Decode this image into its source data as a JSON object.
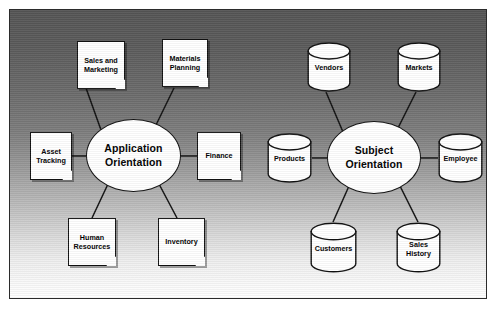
{
  "diagram": {
    "background": {
      "gradient_from": "#555555",
      "gradient_to": "#ffffff",
      "border_color": "#2b2b2b"
    },
    "hubs": [
      {
        "id": "application-orientation",
        "label": "Application\nOrientation",
        "line1": "Application",
        "line2": "Orientation",
        "shape": "ellipse"
      },
      {
        "id": "subject-orientation",
        "label": "Subject\nOrientation",
        "line1": "Subject",
        "line2": "Orientation",
        "shape": "ellipse"
      }
    ],
    "application_nodes": [
      {
        "id": "sales-and-marketing",
        "line1": "Sales and",
        "line2": "Marketing",
        "shape": "document"
      },
      {
        "id": "materials-planning",
        "line1": "Materials",
        "line2": "Planning",
        "shape": "document"
      },
      {
        "id": "asset-tracking",
        "line1": "Asset",
        "line2": "Tracking",
        "shape": "document"
      },
      {
        "id": "finance",
        "line1": "Finance",
        "line2": "",
        "shape": "document"
      },
      {
        "id": "human-resources",
        "line1": "Human",
        "line2": "Resources",
        "shape": "document"
      },
      {
        "id": "inventory",
        "line1": "Inventory",
        "line2": "",
        "shape": "document"
      }
    ],
    "subject_nodes": [
      {
        "id": "vendors",
        "line1": "Vendors",
        "line2": "",
        "shape": "cylinder"
      },
      {
        "id": "markets",
        "line1": "Markets",
        "line2": "",
        "shape": "cylinder"
      },
      {
        "id": "products",
        "line1": "Products",
        "line2": "",
        "shape": "cylinder"
      },
      {
        "id": "employee",
        "line1": "Employee",
        "line2": "",
        "shape": "cylinder"
      },
      {
        "id": "customers",
        "line1": "Customers",
        "line2": "",
        "shape": "cylinder"
      },
      {
        "id": "sales-history",
        "line1": "Sales",
        "line2": "History",
        "shape": "cylinder"
      }
    ]
  }
}
